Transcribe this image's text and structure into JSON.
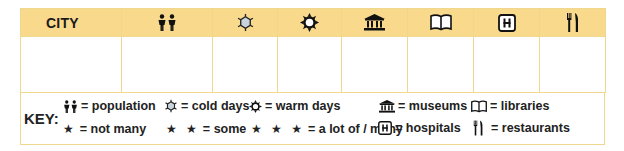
{
  "table": {
    "headers": [
      {
        "key": "city",
        "label": "CITY"
      },
      {
        "key": "population",
        "icon": "people-icon"
      },
      {
        "key": "cold_days",
        "icon": "snowflake-icon"
      },
      {
        "key": "warm_days",
        "icon": "sun-icon"
      },
      {
        "key": "museums",
        "icon": "museum-icon"
      },
      {
        "key": "libraries",
        "icon": "book-icon"
      },
      {
        "key": "hospitals",
        "icon": "hospital-icon"
      },
      {
        "key": "restaurants",
        "icon": "fork-knife-icon"
      }
    ],
    "rows": [
      {
        "city": "",
        "population": "",
        "cold_days": "",
        "warm_days": "",
        "museums": "",
        "libraries": "",
        "hospitals": "",
        "restaurants": ""
      }
    ]
  },
  "key": {
    "label": "KEY:",
    "items": [
      {
        "icon": "people-icon",
        "text": "= population"
      },
      {
        "icon": "snowflake-icon",
        "text": "= cold days"
      },
      {
        "icon": "sun-icon",
        "text": "= warm days"
      },
      {
        "icon": "museum-icon",
        "text": "= museums"
      },
      {
        "icon": "book-icon",
        "text": "= libraries"
      },
      {
        "stars": "★",
        "text": "= not many"
      },
      {
        "stars": "★ ★",
        "text": "= some"
      },
      {
        "stars": "★ ★ ★",
        "text": "= a lot of / many"
      },
      {
        "icon": "hospital-icon",
        "text": "= hospitals"
      },
      {
        "icon": "fork-knife-icon",
        "text": "= restaurants"
      }
    ]
  },
  "colors": {
    "header_bg": "#f9d98c",
    "border": "#f0d78e",
    "text": "#1a1a1a"
  }
}
